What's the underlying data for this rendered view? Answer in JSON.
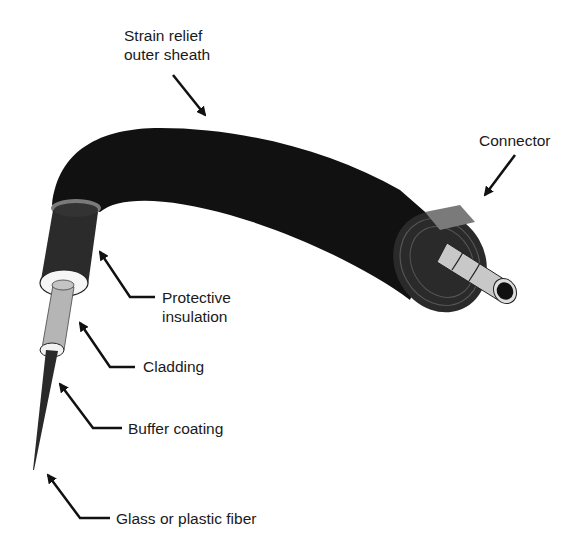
{
  "diagram": {
    "type": "labeled-illustration",
    "colors": {
      "background": "#ffffff",
      "sheath": "#111111",
      "insulation": "#2b2b2b",
      "ring": "#7a7a7a",
      "cladding": "#b5b5b5",
      "buffer": "#f2f2f2",
      "connector_body": "#2a2a2a",
      "ferrule": "#c8c8c8",
      "text": "#1a1a1a"
    },
    "labels": [
      {
        "id": "strain-relief",
        "lines": [
          "Strain relief",
          "outer sheath"
        ]
      },
      {
        "id": "connector",
        "lines": [
          "Connector"
        ]
      },
      {
        "id": "protective-insulation",
        "lines": [
          "Protective",
          "insulation"
        ]
      },
      {
        "id": "cladding",
        "lines": [
          "Cladding"
        ]
      },
      {
        "id": "buffer-coating",
        "lines": [
          "Buffer coating"
        ]
      },
      {
        "id": "fiber",
        "lines": [
          "Glass or plastic fiber"
        ]
      }
    ]
  }
}
